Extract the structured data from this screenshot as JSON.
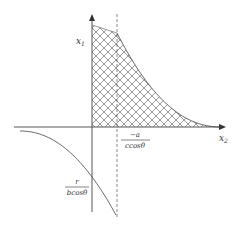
{
  "diagram": {
    "type": "feasible-region-plot",
    "axes": {
      "vertical_label_main": "x",
      "vertical_label_sub": "1",
      "horizontal_label_main": "x",
      "horizontal_label_sub": "2"
    },
    "annotations": {
      "dashed_line_numerator": "−a",
      "dashed_line_denominator": "ccosθ",
      "curve_intercept_numerator": "r",
      "curve_intercept_denominator": "bcosθ"
    },
    "elements": [
      "hatched-feasible-region",
      "hyperbolic-boundary-curve",
      "vertical-dashed-asymptote",
      "lower-left-concave-curve"
    ],
    "colors": {
      "line": "#444444",
      "hatch": "#555555",
      "background": "#ffffff"
    }
  }
}
